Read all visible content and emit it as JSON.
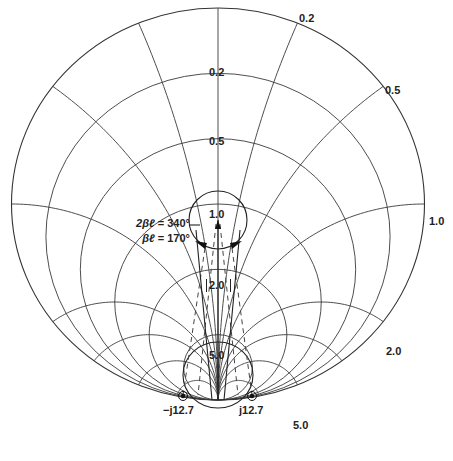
{
  "chart_data": {
    "type": "smith_chart",
    "orientation": "short-circuit point at bottom, open-circuit at top",
    "resistance_circles": [
      0.2,
      0.5,
      1.0,
      2.0,
      5.0
    ],
    "reactance_arcs": [
      0.2,
      0.5,
      1.0,
      2.0,
      5.0
    ],
    "resistance_labels": [
      {
        "text": "0.2",
        "r": 0.2
      },
      {
        "text": "0.5",
        "r": 0.5
      },
      {
        "text": "1.0",
        "r": 1.0
      },
      {
        "text": "2.0",
        "r": 2.0,
        "boxed": true
      },
      {
        "text": "5.0",
        "r": 5.0
      }
    ],
    "reactance_labels": [
      {
        "text": "0.2",
        "x": 0.2
      },
      {
        "text": "0.5",
        "x": 0.5
      },
      {
        "text": "1.0",
        "x": 1.0
      },
      {
        "text": "2.0",
        "x": 2.0
      },
      {
        "text": "5.0",
        "x": 5.0
      }
    ],
    "swr_circle": {
      "center_r": 1.0,
      "note": "small circle around r=1.0 point"
    },
    "lower_circle": {
      "around": "5.0"
    },
    "markers": [
      {
        "label": "−j12.7",
        "side": "left"
      },
      {
        "label": "j12.7",
        "side": "right"
      }
    ],
    "annotation": {
      "line1_prefix": "2βℓ",
      "line1_value": "= 340°",
      "line2_prefix": "βℓ",
      "line2_value": "= 170°"
    }
  },
  "geometry": {
    "cx": 218,
    "cy": 204,
    "rx": 206.5,
    "ry": 196
  },
  "labels": {
    "r_0_2": "0.2",
    "r_0_5": "0.5",
    "r_1_0": "1.0",
    "r_2_0": "2.0",
    "r_5_0": "5.0",
    "x_0_2": "0.2",
    "x_0_5": "0.5",
    "x_1_0": "1.0",
    "x_2_0": "2.0",
    "x_5_0": "5.0",
    "marker_left": "−j12.7",
    "marker_right": "j12.7",
    "anno_line1_prefix": "2βℓ",
    "anno_line1_value": " = 340°",
    "anno_line2_prefix": "βℓ",
    "anno_line2_value": " = 170°"
  }
}
